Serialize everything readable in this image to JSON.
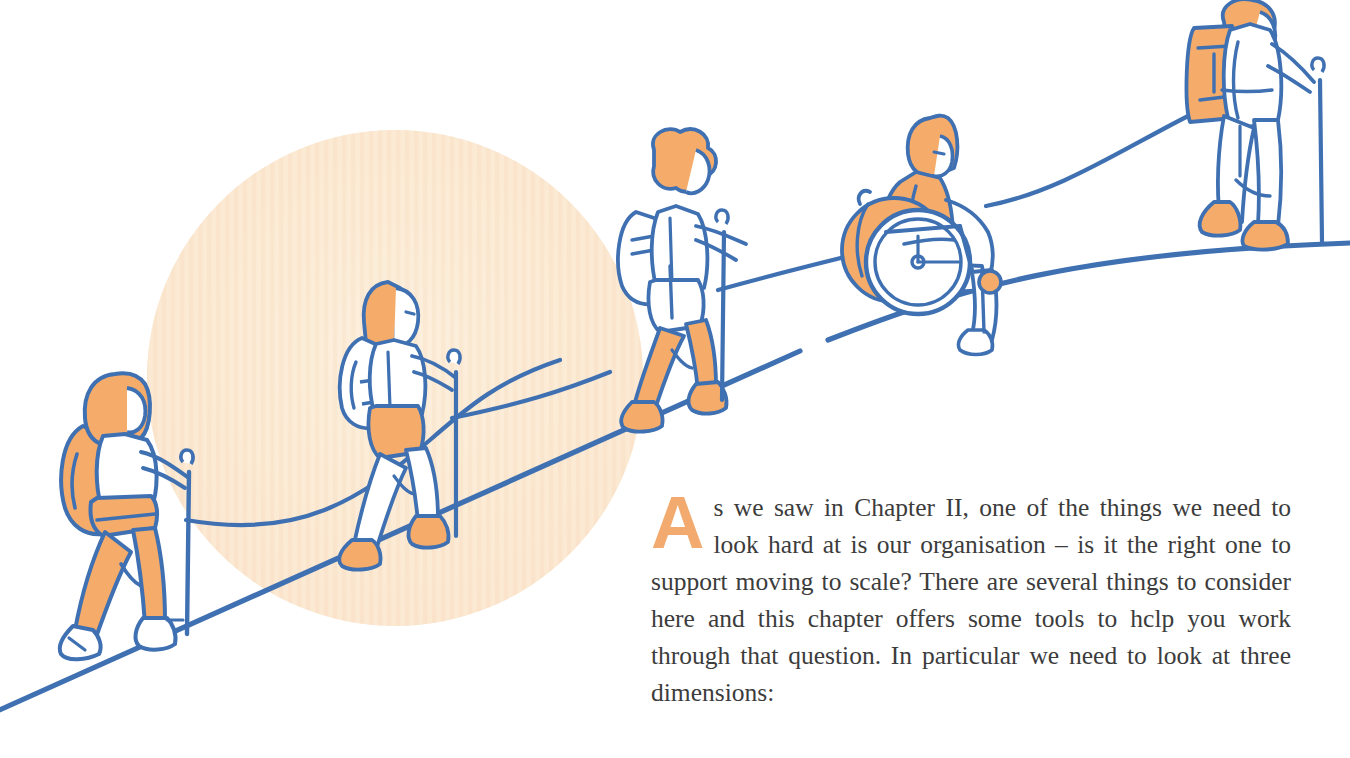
{
  "page": {
    "width": 1350,
    "height": 758,
    "background": "#ffffff"
  },
  "palette": {
    "orange": "#f5ac6b",
    "orange_dropcap": "#f2aa6e",
    "blue_line": "#3f70b2",
    "blob_peach": "#fbe6cd",
    "blob_peach_light": "#fdf2df",
    "text_gray": "#3c3c3c",
    "white": "#ffffff"
  },
  "illustration": {
    "title": "Group of hikers with walking poles and a wheelchair user ascending a slope",
    "background_blob": {
      "name": "peach-circle-blob",
      "shape": "circle",
      "cx": 395,
      "cy": 378,
      "r": 248,
      "fill": "#fbe6cd",
      "stripes": true
    },
    "slope_label": "uphill trail line",
    "rope_label": "connecting guide rope",
    "figures": [
      {
        "id": "hiker-1",
        "label": "hiker with orange hair orange backpack and orange trousers",
        "x": 60,
        "y": 370,
        "order": 1
      },
      {
        "id": "hiker-2",
        "label": "hiker with long orange hair white backpack and orange shorts",
        "x": 335,
        "y": 280,
        "order": 2
      },
      {
        "id": "hiker-3",
        "label": "hiker with curly orange hair white backpack and orange legs",
        "x": 615,
        "y": 130,
        "order": 3
      },
      {
        "id": "wheelchair-user",
        "label": "wheelchair user in orange top ascending the slope",
        "x": 845,
        "y": 115,
        "order": 4
      },
      {
        "id": "hiker-5",
        "label": "lead hiker with orange cap and large orange backpack",
        "x": 1185,
        "y": 0,
        "order": 5
      }
    ]
  },
  "main": {
    "dropcap": "A",
    "paragraph": "s we saw in Chapter II, one of the things we need to look hard at is our organisation – is it the right one to support moving to scale? There are several things to consider here and this chapter offers some tools to hclp you work through that question. In particular we need to look at three dimensions:"
  }
}
